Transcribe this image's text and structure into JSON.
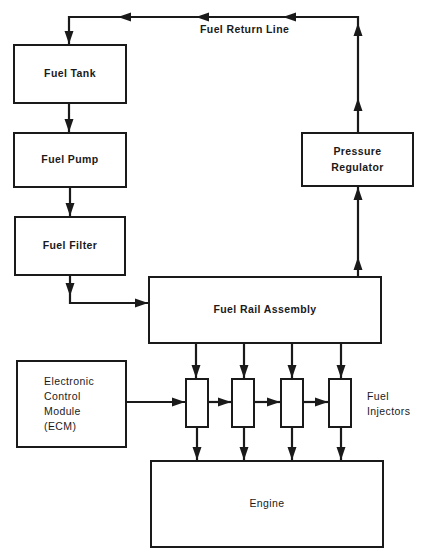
{
  "diagram": {
    "return_line_label": "Fuel Return Line",
    "boxes": {
      "fuel_tank": "Fuel Tank",
      "fuel_pump": "Fuel Pump",
      "fuel_filter": "Fuel Filter",
      "pressure_regulator": "Pressure\nRegulator",
      "fuel_rail_assembly": "Fuel Rail Assembly",
      "ecm": "Electronic\nControl\nModule\n(ECM)",
      "engine": "Engine"
    },
    "injectors_label": "Fuel\nInjectors",
    "injector_count": 4,
    "line_color": "#1a1a1a"
  }
}
